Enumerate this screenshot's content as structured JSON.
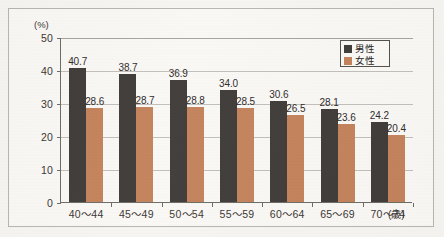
{
  "chart_data": {
    "type": "bar",
    "title": "",
    "xlabel": "(歳)",
    "ylabel": "(%)",
    "ylim": [
      0,
      50
    ],
    "yticks": [
      0,
      10,
      20,
      30,
      40,
      50
    ],
    "ytick_labels": [
      "0",
      "10",
      "20",
      "30",
      "40",
      "50"
    ],
    "grid": true,
    "legend_position": "top-right-inside",
    "categories": [
      "40〜44",
      "45〜49",
      "50〜54",
      "55〜59",
      "60〜64",
      "65〜69",
      "70〜74"
    ],
    "series": [
      {
        "name": "男性",
        "color": "#413d3a",
        "values": [
          40.7,
          38.7,
          36.9,
          34.0,
          30.6,
          28.1,
          24.2
        ],
        "labels": [
          "40.7",
          "38.7",
          "36.9",
          "34.0",
          "30.6",
          "28.1",
          "24.2"
        ]
      },
      {
        "name": "女性",
        "color": "#c4835c",
        "values": [
          28.6,
          28.7,
          28.8,
          28.5,
          26.5,
          23.6,
          20.4
        ],
        "labels": [
          "28.6",
          "28.7",
          "28.8",
          "28.5",
          "26.5",
          "23.6",
          "20.4"
        ]
      }
    ]
  },
  "axes": {
    "y_unit_label": "(%)",
    "x_unit_label": "(歳)"
  },
  "legend": {
    "entries": [
      {
        "label": "男性",
        "swatch": "male-swatch-icon"
      },
      {
        "label": "女性",
        "swatch": "female-swatch-icon"
      }
    ]
  }
}
